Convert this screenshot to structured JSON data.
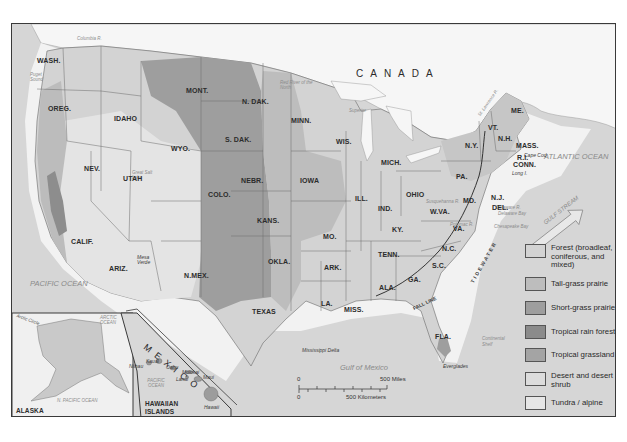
{
  "map": {
    "country_labels": {
      "canada": "CANADA",
      "mexico": "MEXICO"
    },
    "water_labels": {
      "pacific": "PACIFIC OCEAN",
      "atlantic": "ATLANTIC OCEAN",
      "gulf_of_mexico": "Gulf of Mexico",
      "gulf_stream": "GULF STREAM",
      "superior": "Superior",
      "lake_michigan": "L. Michigan",
      "lake_huron": "L. Huron",
      "lake_erie": "L. Erie",
      "great_salt_lake": "Great Salt Lake",
      "columbia_r": "Columbia R.",
      "snake_r": "Snake R.",
      "colorado_r": "Colorado R.",
      "gila_r": "Gila R.",
      "red_r": "Red R.",
      "rio_grande": "Rio Grande",
      "arkansas_r": "Arkansas R.",
      "ohio_r": "Ohio R.",
      "st_lawrence_r": "St. Lawrence R.",
      "susquehanna_r": "Susquehanna R.",
      "potomac_r": "Potomac R.",
      "delaware_r": "Delaware R.",
      "delaware_bay": "Delaware Bay",
      "chesapeake_bay": "Chesapeake Bay",
      "puget_sound": "Puget Sound",
      "red_river_north": "Red River of the North",
      "continental_shelf": "Continental Shelf"
    },
    "place_labels": {
      "mesa_verde": "Mesa Verde",
      "cape_cod": "Cape Cod",
      "long_i": "Long I.",
      "mississippi_delta": "Mississippi Delta",
      "everglades": "Everglades",
      "fall_line": "FALL LINE",
      "tidewater": "TIDEWATER",
      "niagara_falls": "Niagara Falls"
    },
    "states": [
      {
        "id": "wash",
        "label": "WASH.",
        "x": 36,
        "y": 56
      },
      {
        "id": "oreg",
        "label": "OREG.",
        "x": 47,
        "y": 104
      },
      {
        "id": "idaho",
        "label": "IDAHO",
        "x": 113,
        "y": 114
      },
      {
        "id": "mont",
        "label": "MONT.",
        "x": 185,
        "y": 86
      },
      {
        "id": "wyo",
        "label": "WYO.",
        "x": 170,
        "y": 144
      },
      {
        "id": "nev",
        "label": "NEV.",
        "x": 83,
        "y": 164
      },
      {
        "id": "utah",
        "label": "UTAH",
        "x": 122,
        "y": 174
      },
      {
        "id": "colo",
        "label": "COLO.",
        "x": 207,
        "y": 190
      },
      {
        "id": "calif",
        "label": "CALIF.",
        "x": 70,
        "y": 237
      },
      {
        "id": "ariz",
        "label": "ARIZ.",
        "x": 108,
        "y": 264
      },
      {
        "id": "nmex",
        "label": "N.MEX.",
        "x": 183,
        "y": 271
      },
      {
        "id": "ndak",
        "label": "N. DAK.",
        "x": 241,
        "y": 97
      },
      {
        "id": "sdak",
        "label": "S. DAK.",
        "x": 224,
        "y": 135
      },
      {
        "id": "nebr",
        "label": "NEBR.",
        "x": 240,
        "y": 176
      },
      {
        "id": "kans",
        "label": "KANS.",
        "x": 256,
        "y": 216
      },
      {
        "id": "okla",
        "label": "OKLA.",
        "x": 267,
        "y": 257
      },
      {
        "id": "texas",
        "label": "TEXAS",
        "x": 251,
        "y": 307
      },
      {
        "id": "minn",
        "label": "MINN.",
        "x": 290,
        "y": 116
      },
      {
        "id": "iowa",
        "label": "IOWA",
        "x": 299,
        "y": 176
      },
      {
        "id": "mo",
        "label": "MO.",
        "x": 322,
        "y": 232
      },
      {
        "id": "ark",
        "label": "ARK.",
        "x": 323,
        "y": 263
      },
      {
        "id": "la",
        "label": "LA.",
        "x": 320,
        "y": 299
      },
      {
        "id": "wis",
        "label": "WIS.",
        "x": 335,
        "y": 137
      },
      {
        "id": "ill",
        "label": "ILL.",
        "x": 354,
        "y": 194
      },
      {
        "id": "miss",
        "label": "MISS.",
        "x": 343,
        "y": 305
      },
      {
        "id": "mich",
        "label": "MICH.",
        "x": 380,
        "y": 158
      },
      {
        "id": "ind",
        "label": "IND.",
        "x": 377,
        "y": 204
      },
      {
        "id": "ky",
        "label": "KY.",
        "x": 391,
        "y": 225
      },
      {
        "id": "tenn",
        "label": "TENN.",
        "x": 377,
        "y": 250
      },
      {
        "id": "ala",
        "label": "ALA.",
        "x": 378,
        "y": 283
      },
      {
        "id": "ohio",
        "label": "OHIO",
        "x": 405,
        "y": 190
      },
      {
        "id": "ga",
        "label": "GA.",
        "x": 407,
        "y": 275
      },
      {
        "id": "fla",
        "label": "FLA.",
        "x": 434,
        "y": 332
      },
      {
        "id": "wva",
        "label": "W.VA.",
        "x": 429,
        "y": 207
      },
      {
        "id": "va",
        "label": "VA.",
        "x": 452,
        "y": 224
      },
      {
        "id": "nc",
        "label": "N.C.",
        "x": 441,
        "y": 244
      },
      {
        "id": "sc",
        "label": "S.C.",
        "x": 431,
        "y": 261
      },
      {
        "id": "pa",
        "label": "PA.",
        "x": 455,
        "y": 172
      },
      {
        "id": "ny",
        "label": "N.Y.",
        "x": 464,
        "y": 141
      },
      {
        "id": "md",
        "label": "MD.",
        "x": 462,
        "y": 196
      },
      {
        "id": "nj",
        "label": "N.J.",
        "x": 490,
        "y": 193
      },
      {
        "id": "del",
        "label": "DEL.",
        "x": 491,
        "y": 203
      },
      {
        "id": "vt",
        "label": "VT.",
        "x": 487,
        "y": 123
      },
      {
        "id": "nh",
        "label": "N.H.",
        "x": 497,
        "y": 134
      },
      {
        "id": "me",
        "label": "ME.",
        "x": 510,
        "y": 106
      },
      {
        "id": "mass",
        "label": "MASS.",
        "x": 515,
        "y": 141
      },
      {
        "id": "ri",
        "label": "R.I.",
        "x": 516,
        "y": 153
      },
      {
        "id": "conn",
        "label": "CONN.",
        "x": 512,
        "y": 160
      }
    ],
    "alaska_inset": {
      "title": "ALASKA",
      "arctic_circle": "Arctic Circle",
      "arctic_ocean": "ARCTIC OCEAN",
      "n_pacific": "N. PACIFIC OCEAN",
      "yukon_r": "Yukon R."
    },
    "hawaii_inset": {
      "title_line1": "HAWAIIAN",
      "title_line2": "ISLANDS",
      "ocean": "PACIFIC OCEAN",
      "islands": [
        "Niihau",
        "Kauai",
        "Oahu",
        "Molokai",
        "Lanai",
        "Maui",
        "Hawaii"
      ]
    },
    "scale_bar": {
      "zero_top": "0",
      "miles": "500 Miles",
      "zero_bottom": "0",
      "km": "500 Kilometers"
    }
  },
  "legend": {
    "items": [
      {
        "label": "Forest (broadleaf, coniferous, and mixed)",
        "color": "#d3d3d3"
      },
      {
        "label": "Tall-grass prairie",
        "color": "#bdbdbd"
      },
      {
        "label": "Short-grass prairie",
        "color": "#9e9e9e"
      },
      {
        "label": "Tropical rain forest",
        "color": "#8b8b8b"
      },
      {
        "label": "Tropical grassland",
        "color": "#a4a4a4"
      },
      {
        "label": "Desert and desert shrub",
        "color": "#dcdcdc"
      },
      {
        "label": "Tundra / alpine",
        "color": "#e6e6e6"
      }
    ]
  },
  "colors": {
    "ocean": "#d6d6d6",
    "shelf": "#f4f4f4",
    "canada": "#f7f7f7",
    "forest": "#d3d3d3",
    "tallgrass": "#bdbdbd",
    "shortgrass": "#9e9e9e",
    "desert": "#e4e4e4",
    "border": "#3a3a3a"
  }
}
